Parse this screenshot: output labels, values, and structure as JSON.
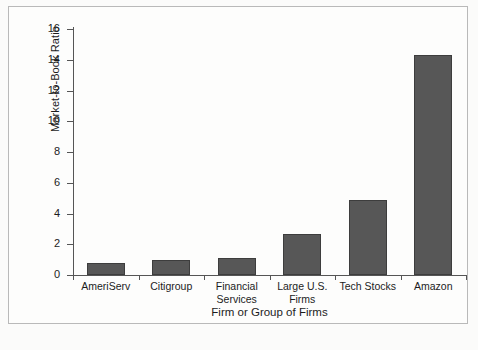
{
  "chart_data": {
    "type": "bar",
    "title": "",
    "xlabel": "Firm or Group of Firms",
    "ylabel": "Market-to-Book Ratio",
    "categories": [
      "AmeriServ",
      "Citigroup",
      "Financial Services",
      "Large U.S. Firms",
      "Tech Stocks",
      "Amazon"
    ],
    "values": [
      0.75,
      1.0,
      1.1,
      2.7,
      4.9,
      14.3
    ],
    "ylim": [
      0,
      16
    ],
    "yticks": [
      0,
      2,
      4,
      6,
      8,
      10,
      12,
      14,
      16
    ],
    "ytick_labels": [
      "0",
      "2",
      "4",
      "6",
      "8",
      "10",
      "12",
      "14",
      "16"
    ],
    "grid": false,
    "legend": null,
    "bar_color": "#575757",
    "axis_color": "#555555",
    "background_color": "#fdfdfc"
  },
  "axes": {
    "y_title": "Market-to-Book Ratio",
    "x_title": "Firm or Group of Firms"
  },
  "category_labels": [
    {
      "line1": "AmeriServ",
      "line2": ""
    },
    {
      "line1": "Citigroup",
      "line2": ""
    },
    {
      "line1": "Financial",
      "line2": "Services"
    },
    {
      "line1": "Large U.S.",
      "line2": "Firms"
    },
    {
      "line1": "Tech Stocks",
      "line2": ""
    },
    {
      "line1": "Amazon",
      "line2": ""
    }
  ]
}
